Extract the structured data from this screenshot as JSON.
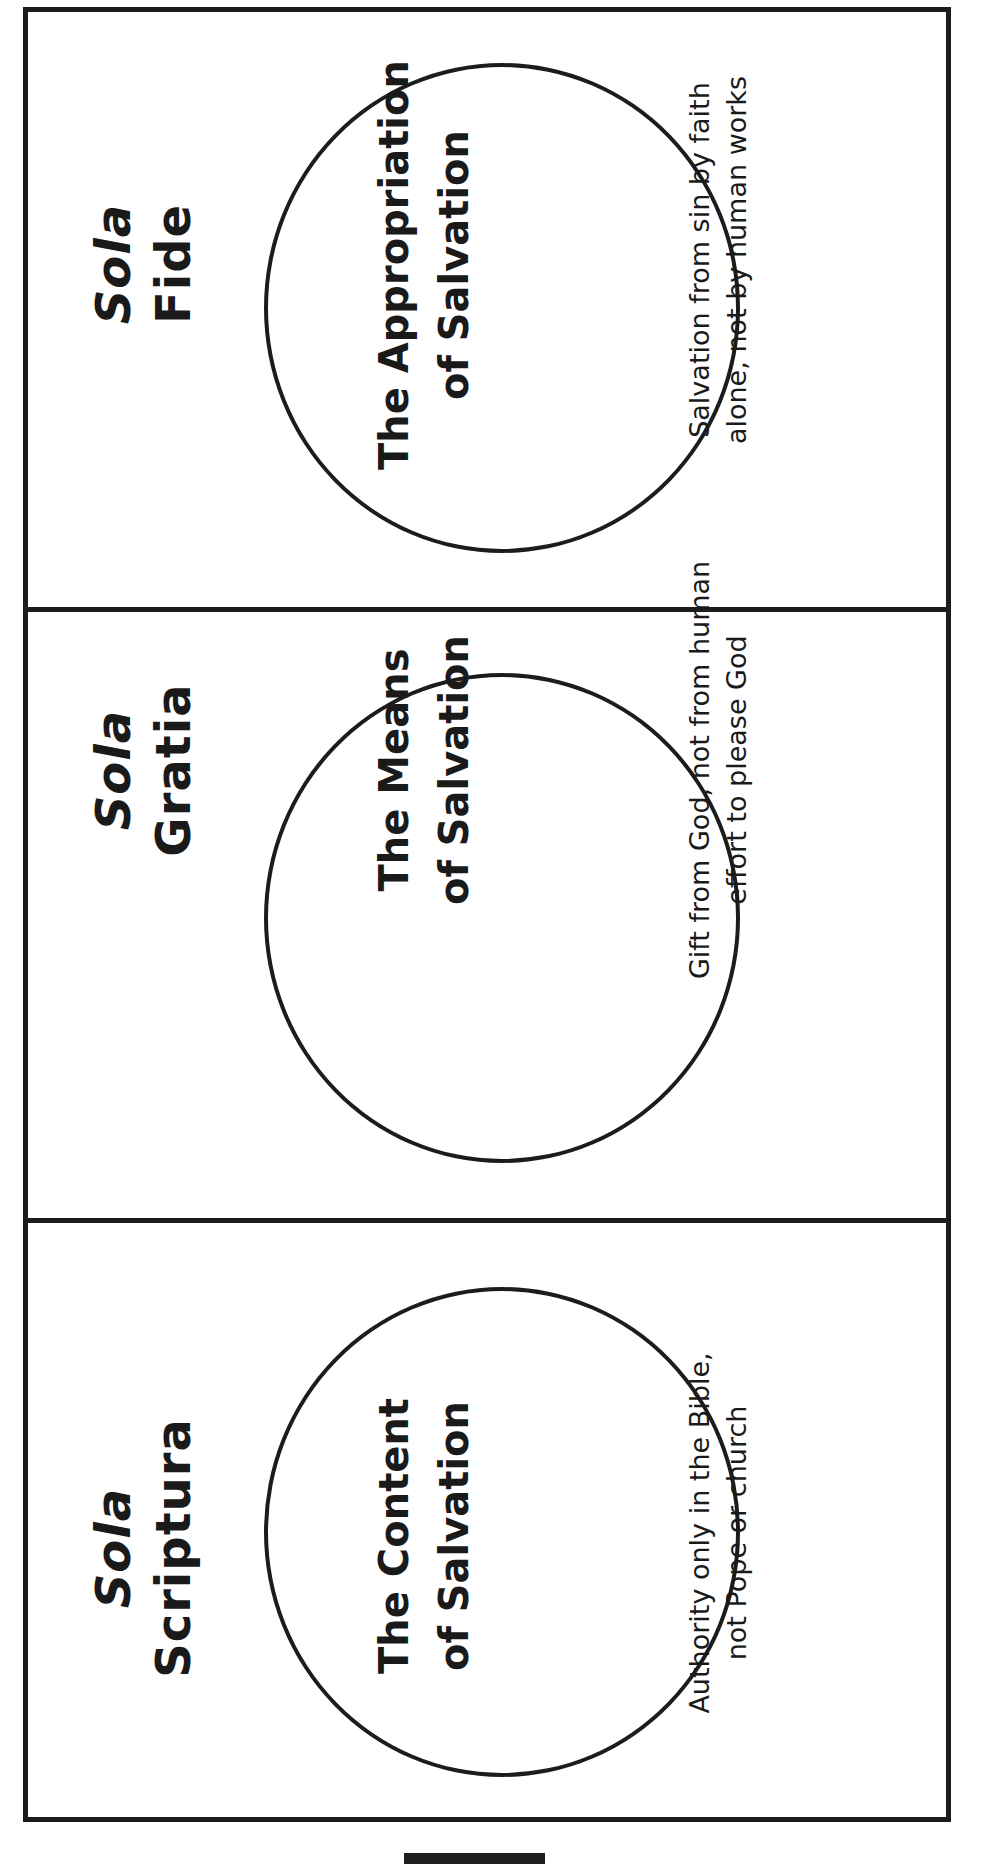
{
  "document": {
    "colors": {
      "ink": "#1c1c1c",
      "background": "#ffffff"
    },
    "panels": [
      {
        "heading": [
          "Sola",
          "Fide"
        ],
        "circle_text": [
          "The Appropriation",
          "of Salvation"
        ],
        "description": [
          "Salvation from sin by faith",
          "alone, not by human works"
        ]
      },
      {
        "heading": [
          "Sola",
          "Gratia"
        ],
        "circle_text": [
          "The Means",
          "of Salvation"
        ],
        "description": [
          "Gift from God, not from human",
          "effort to please God"
        ]
      },
      {
        "heading": [
          "Sola",
          "Scriptura"
        ],
        "circle_text": [
          "The Content",
          "of Salvation"
        ],
        "description": [
          "Authority only in the Bible,",
          "not Pope or church"
        ]
      }
    ]
  }
}
